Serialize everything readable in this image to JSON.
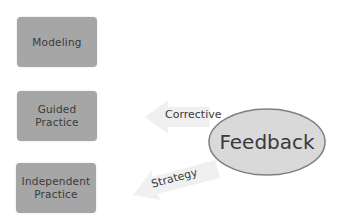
{
  "boxes": {
    "modeling": "Modeling",
    "guided": [
      "Guided",
      "Practice"
    ],
    "independent": [
      "Independent",
      "Practice"
    ]
  },
  "arrows": {
    "corrective": "Corrective",
    "strategy": "Strategy"
  },
  "feedback": "Feedback",
  "colors": {
    "box_fill": "#a6a6a6",
    "ellipse_fill": "#d9d9d9",
    "ellipse_stroke": "#7f7f7f",
    "arrow_fill": "#f0f0f0",
    "text": "#3a3a3a"
  }
}
